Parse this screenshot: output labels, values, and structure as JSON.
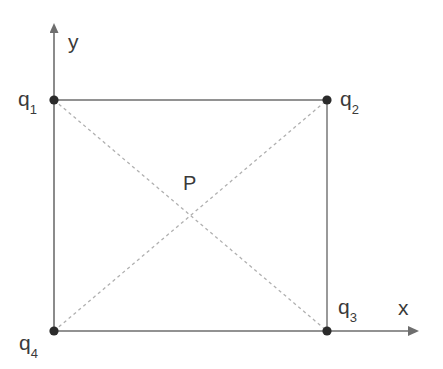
{
  "diagram": {
    "type": "physics-geometry",
    "colors": {
      "solid_line": "#6e6e6e",
      "dashed_line": "#b4b4b4",
      "axis": "#6e6e6e",
      "dot": "#2b2b2b",
      "text": "#3a3a3a",
      "background": "#ffffff"
    },
    "axes": {
      "x_label": "x",
      "y_label": "y",
      "origin": {
        "x": 54,
        "y": 331
      },
      "x_arrow_tip": {
        "x": 420,
        "y": 331
      },
      "y_arrow_tip": {
        "x": 54,
        "y": 25
      }
    },
    "charges": [
      {
        "id": "q1",
        "symbol": "q",
        "subscript": "1",
        "x": 54,
        "y": 100,
        "label_x": 18,
        "label_y": 88
      },
      {
        "id": "q2",
        "symbol": "q",
        "subscript": "2",
        "x": 327,
        "y": 100,
        "label_x": 340,
        "label_y": 88
      },
      {
        "id": "q3",
        "symbol": "q",
        "subscript": "3",
        "x": 327,
        "y": 331,
        "label_x": 338,
        "label_y": 296
      },
      {
        "id": "q4",
        "symbol": "q",
        "subscript": "4",
        "x": 54,
        "y": 331,
        "label_x": 19,
        "label_y": 332
      }
    ],
    "point_p": {
      "id": "P",
      "label": "P",
      "x": 190,
      "y": 215,
      "label_x": 183,
      "label_y": 173
    },
    "rectangle": {
      "left": 54,
      "top": 100,
      "right": 327,
      "bottom": 331,
      "width": 273,
      "height": 231
    },
    "diagonals": [
      {
        "from": "q1",
        "to": "q3"
      },
      {
        "from": "q4",
        "to": "q2"
      }
    ],
    "dot_radius": 4.5
  }
}
